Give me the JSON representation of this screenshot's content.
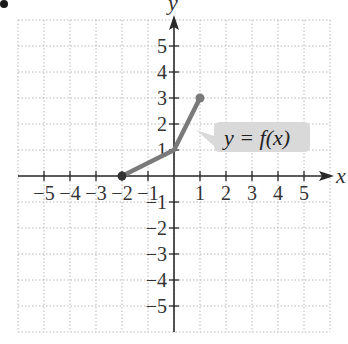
{
  "chart_data": {
    "type": "line",
    "title": "",
    "xlabel": "x",
    "ylabel": "y",
    "xlim": [
      -6,
      6
    ],
    "ylim": [
      -6,
      6
    ],
    "grid": true,
    "x_ticks": [
      -5,
      -4,
      -3,
      -2,
      -1,
      1,
      2,
      3,
      4,
      5
    ],
    "y_ticks": [
      -5,
      -4,
      -3,
      -2,
      -1,
      1,
      2,
      3,
      4,
      5
    ],
    "x_tick_labels": [
      "−5",
      "−4",
      "−3",
      "−2",
      "−1",
      "1",
      "2",
      "3",
      "4",
      "5"
    ],
    "y_tick_labels": [
      "−5",
      "−4",
      "−3",
      "−2",
      "−1",
      "1",
      "2",
      "3",
      "4",
      "5"
    ],
    "series": [
      {
        "name": "y = f(x)",
        "points": [
          [
            -2,
            0
          ],
          [
            0,
            1
          ],
          [
            1,
            3
          ]
        ],
        "endpoints": "closed",
        "color": "#7a7a7a"
      }
    ],
    "annotations": [
      {
        "text": "y = f(x)",
        "type": "callout",
        "position": [
          2.5,
          1.4
        ]
      }
    ]
  },
  "ui": {
    "callout_label": "y = f(x)",
    "x_axis_label": "x",
    "y_axis_label": "y",
    "colors": {
      "curve": "#7a7a7a",
      "callout_bg": "#d9d9d9",
      "axis": "#2a2a2a",
      "grid": "#b8b8b8"
    }
  }
}
